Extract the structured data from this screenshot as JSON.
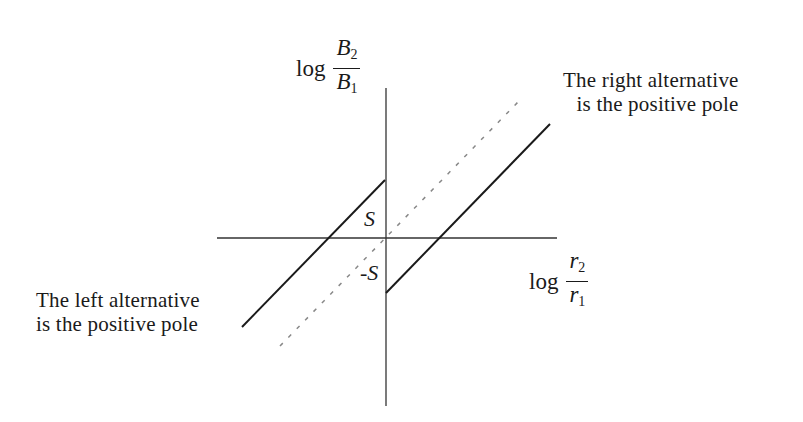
{
  "diagram": {
    "y_axis_label": {
      "prefix": "log",
      "numerator": "B",
      "numerator_sub": "2",
      "denominator": "B",
      "denominator_sub": "1"
    },
    "x_axis_label": {
      "prefix": "log",
      "numerator": "r",
      "numerator_sub": "2",
      "denominator": "r",
      "denominator_sub": "1"
    },
    "intercepts": {
      "upper": "S",
      "lower": "-S"
    },
    "annotations": {
      "right": [
        "The right alternative",
        "is the positive pole"
      ],
      "left": [
        "The left alternative",
        "is the positive pole"
      ]
    },
    "lines": [
      {
        "name": "left-alternative-line",
        "style": "solid",
        "from": [
          242,
          327
        ],
        "to": [
          385,
          180
        ]
      },
      {
        "name": "diagonal-reference-line",
        "style": "dashed",
        "from": [
          280,
          346
        ],
        "to": [
          518,
          102
        ]
      },
      {
        "name": "right-alternative-line",
        "style": "solid",
        "from": [
          386,
          293
        ],
        "to": [
          550,
          124
        ]
      }
    ],
    "colors": {
      "ink": "#1a1a1a",
      "axis": "#333333",
      "dashed": "#888888",
      "background": "#ffffff"
    }
  }
}
